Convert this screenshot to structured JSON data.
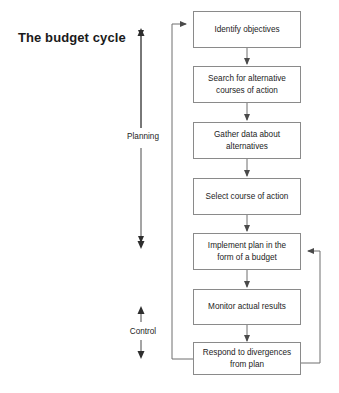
{
  "diagram": {
    "title": "The budget cycle",
    "colors": {
      "node_border": "#8a8a8a",
      "arrow": "#6e6e6e",
      "bracket": "#4a4a4a",
      "text": "#1c1c1c",
      "background": "#ffffff"
    },
    "nodes": [
      {
        "id": "identify-objectives",
        "lines": [
          "Identify objectives"
        ]
      },
      {
        "id": "search-alternatives",
        "lines": [
          "Search for alternative",
          "courses of action"
        ]
      },
      {
        "id": "gather-data",
        "lines": [
          "Gather data about",
          "alternatives"
        ]
      },
      {
        "id": "select-course",
        "lines": [
          "Select course of action"
        ]
      },
      {
        "id": "implement-plan",
        "lines": [
          "Implement plan in the",
          "form of a budget"
        ]
      },
      {
        "id": "monitor-results",
        "lines": [
          "Monitor actual results"
        ]
      },
      {
        "id": "respond-divergences",
        "lines": [
          "Respond to divergences",
          "from plan"
        ]
      }
    ],
    "brackets": [
      {
        "id": "planning",
        "label": "Planning"
      },
      {
        "id": "control",
        "label": "Control"
      }
    ],
    "footer": ""
  }
}
